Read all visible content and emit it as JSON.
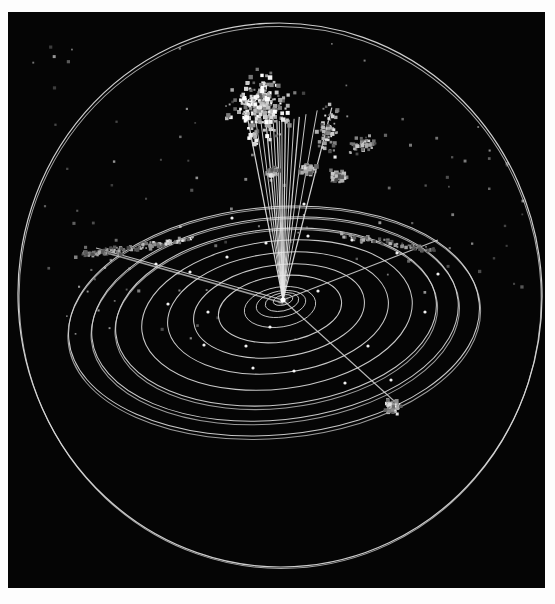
{
  "figure": {
    "kind": "orbit-diagram",
    "background_color": "#050505",
    "page_color": "#fdfdfd",
    "stroke_color": "#d9d9d9",
    "particle_color": "#e8e8e8",
    "canvas": {
      "x": 8,
      "y": 12,
      "width": 537,
      "height": 576
    },
    "center": {
      "x": 275,
      "y": 288
    }
  },
  "chart_data": {
    "type": "scatter",
    "subtitle": "",
    "xlabel": "",
    "ylabel": "",
    "grid": false,
    "legend": "none",
    "projection": "ecliptic-tilted",
    "center_marker": {
      "name": "sun",
      "x": 275,
      "y": 288,
      "r": 2.6,
      "color": "#ffffff"
    },
    "orbits": [
      {
        "name": "orbit-1",
        "rx": 10,
        "ry": 5,
        "cx": 275,
        "cy": 288,
        "rotate": -14,
        "dx": 1,
        "dy": 1
      },
      {
        "name": "orbit-2",
        "rx": 17,
        "ry": 9,
        "cx": 274,
        "cy": 290,
        "rotate": -12,
        "dx": 2,
        "dy": 2
      },
      {
        "name": "orbit-3",
        "rx": 25,
        "ry": 13,
        "cx": 273,
        "cy": 292,
        "rotate": -10,
        "dx": 3,
        "dy": 3
      },
      {
        "name": "orbit-4",
        "rx": 36,
        "ry": 20,
        "cx": 272,
        "cy": 295,
        "rotate": -9,
        "dx": 4,
        "dy": 5
      },
      {
        "name": "orbit-5",
        "rx": 62,
        "ry": 33,
        "cx": 272,
        "cy": 297,
        "rotate": -8,
        "dx": 5,
        "dy": 7
      },
      {
        "name": "orbit-6",
        "rx": 86,
        "ry": 46,
        "cx": 271,
        "cy": 299,
        "rotate": -8,
        "dx": 6,
        "dy": 9
      },
      {
        "name": "orbit-7",
        "rx": 111,
        "ry": 60,
        "cx": 270,
        "cy": 301,
        "rotate": -7,
        "dx": 7,
        "dy": 11
      },
      {
        "name": "orbit-8",
        "rx": 136,
        "ry": 74,
        "cx": 269,
        "cy": 303,
        "rotate": -7,
        "dx": 8,
        "dy": 13
      },
      {
        "name": "orbit-9",
        "rx": 161,
        "ry": 88,
        "cx": 268,
        "cy": 305,
        "rotate": -6,
        "dx": 9,
        "dy": 15
      },
      {
        "name": "orbit-10",
        "rx": 184,
        "ry": 101,
        "cx": 267,
        "cy": 307,
        "rotate": -6,
        "dx": 10,
        "dy": 17
      },
      {
        "name": "orbit-11",
        "rx": 206,
        "ry": 114,
        "cx": 266,
        "cy": 309,
        "rotate": -5,
        "dx": 11,
        "dy": 19
      }
    ],
    "outer_orbit": {
      "name": "outer-orbit",
      "rx": 262,
      "ry": 272,
      "cx": 272,
      "cy": 283,
      "rotate": -3
    },
    "fan_lines": {
      "name": "radial-trajectory-fan",
      "count": 16,
      "origin": {
        "x": 275,
        "y": 288
      },
      "angles_deg": [
        -104,
        -101,
        -99,
        -97,
        -95.5,
        -94,
        -92.5,
        -91.5,
        -90.5,
        -89,
        -87.5,
        -85.5,
        -83.5,
        -81,
        -77,
        -72
      ],
      "lengths": [
        150,
        148,
        146,
        144,
        143,
        142,
        141,
        140,
        140,
        140,
        141,
        142,
        144,
        147,
        152,
        158
      ]
    },
    "axis_lines": [
      {
        "name": "ecliptic-line-left",
        "x1": 275,
        "y1": 288,
        "x2": 88,
        "y2": 236
      },
      {
        "name": "ecliptic-line-right",
        "x1": 275,
        "y1": 288,
        "x2": 430,
        "y2": 228
      },
      {
        "name": "node-line-lower",
        "x1": 275,
        "y1": 288,
        "x2": 385,
        "y2": 388
      }
    ],
    "clusters": [
      {
        "name": "cluster-top-main",
        "cx": 252,
        "cy": 96,
        "rx": 42,
        "ry": 52,
        "count": 260,
        "brightness": 0.88,
        "size": 3.1
      },
      {
        "name": "cluster-top-right",
        "cx": 320,
        "cy": 120,
        "rx": 16,
        "ry": 32,
        "count": 60,
        "brightness": 0.74,
        "size": 2.8
      },
      {
        "name": "cluster-top-far",
        "cx": 355,
        "cy": 133,
        "rx": 24,
        "ry": 12,
        "count": 42,
        "brightness": 0.66,
        "size": 2.6
      },
      {
        "name": "cluster-ring-a",
        "cx": 265,
        "cy": 160,
        "rx": 9,
        "ry": 6,
        "count": 34,
        "brightness": 0.72,
        "size": 3.4
      },
      {
        "name": "cluster-ring-b",
        "cx": 300,
        "cy": 158,
        "rx": 12,
        "ry": 7,
        "count": 46,
        "brightness": 0.7,
        "size": 3.5
      },
      {
        "name": "cluster-ring-c",
        "cx": 330,
        "cy": 165,
        "rx": 12,
        "ry": 8,
        "count": 44,
        "brightness": 0.7,
        "size": 3.3
      },
      {
        "name": "cluster-lower-right",
        "cx": 385,
        "cy": 395,
        "rx": 11,
        "ry": 11,
        "count": 90,
        "brightness": 0.8,
        "size": 2.6
      }
    ],
    "streams": [
      {
        "name": "stream-left",
        "x1": 190,
        "y1": 226,
        "x2": 70,
        "y2": 244,
        "count": 130,
        "spread": 6,
        "brightness": 0.78,
        "size": 2.6
      },
      {
        "name": "stream-right",
        "x1": 330,
        "y1": 222,
        "x2": 430,
        "y2": 240,
        "count": 70,
        "spread": 5,
        "brightness": 0.72,
        "size": 2.5
      }
    ],
    "scatter_field": {
      "name": "background-field",
      "count": 115,
      "brightness": 0.5,
      "size": 2.4,
      "region": {
        "x": 20,
        "y": 30,
        "width": 500,
        "height": 300
      }
    },
    "orbit_nodes": {
      "name": "orbit-node-markers",
      "count": 22,
      "color": "#ffffff",
      "radius": 1.6
    }
  }
}
